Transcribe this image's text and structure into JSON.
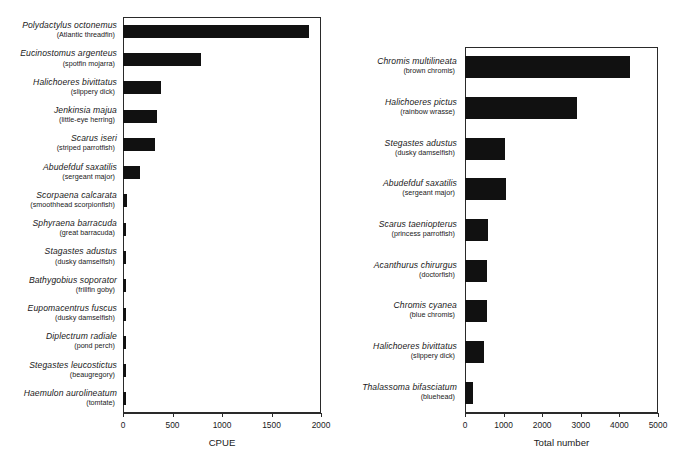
{
  "figure": {
    "background_color": "#ffffff",
    "bar_color": "#111111",
    "axis_color": "#2a2a2a"
  },
  "chart_data": [
    {
      "type": "bar",
      "orientation": "horizontal",
      "title": "",
      "xlabel": "CPUE",
      "ylabel": "",
      "xlim": [
        0,
        2000
      ],
      "xticks": [
        0,
        500,
        1000,
        1500,
        2000
      ],
      "xtick_labels": [
        "0",
        "500",
        "1000",
        "1500",
        "2000"
      ],
      "grid": false,
      "legend": "none",
      "categories": [
        "Polydactylus octonemus",
        "Eucinostomus argenteus",
        "Halichoeres bivittatus",
        "Jenkinsia majua",
        "Scarus iseri",
        "Abudefduf saxatilis",
        "Scorpaena calcarata",
        "Sphyraena barracuda",
        "Stagastes adustus",
        "Bathygobius soporator",
        "Eupomacentrus fuscus",
        "Diplectrum radiale",
        "Stegastes leucostictus",
        "Haemulon aurolineatum"
      ],
      "common_names": [
        "(Atlantic threadfin)",
        "(spotfin mojarra)",
        "(slippery dick)",
        "(little-eye herring)",
        "(striped parrotfish)",
        "(sergeant major)",
        "(smoothhead scorpionfish)",
        "(great barracuda)",
        "(dusky damselfish)",
        "(frillfin goby)",
        "(dusky damselfish)",
        "(pond perch)",
        "(beaugregory)",
        "(tomtate)"
      ],
      "values": [
        1880,
        790,
        385,
        340,
        320,
        175,
        40,
        35,
        35,
        35,
        35,
        35,
        30,
        28
      ]
    },
    {
      "type": "bar",
      "orientation": "horizontal",
      "title": "",
      "xlabel": "Total number",
      "ylabel": "",
      "xlim": [
        0,
        5000
      ],
      "xticks": [
        0,
        1000,
        2000,
        3000,
        4000,
        5000
      ],
      "xtick_labels": [
        "0",
        "1000",
        "2000",
        "3000",
        "4000",
        "5000"
      ],
      "grid": false,
      "legend": "none",
      "categories": [
        "Chromis multilineata",
        "Halichoeres pictus",
        "Stegastes adustus",
        "Abudefduf saxatilis",
        "Scarus taeniopterus",
        "Acanthurus chirurgus",
        "Chromis cyanea",
        "Halichoeres bivittatus",
        "Thalassoma bifasciatum"
      ],
      "common_names": [
        "(brown chromis)",
        "(rainbow wrasse)",
        "(dusky damselfish)",
        "(sergeant major)",
        "(princess parrotfish)",
        "(doctorfish)",
        "(blue chromis)",
        "(slippery dick)",
        "(bluehead)"
      ],
      "values": [
        4270,
        2900,
        1040,
        1060,
        600,
        580,
        580,
        500,
        210
      ]
    }
  ]
}
